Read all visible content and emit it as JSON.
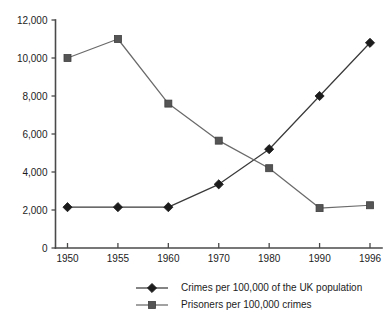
{
  "chart_data": {
    "type": "line",
    "title": "",
    "subtitle": "",
    "xlabel": "",
    "ylabel": "",
    "categories": [
      "1950",
      "1955",
      "1960",
      "1970",
      "1980",
      "1990",
      "1996"
    ],
    "ylim": [
      0,
      12000
    ],
    "ytick_labels": [
      "0",
      "2,000",
      "4,000",
      "6,000",
      "8,000",
      "10,000",
      "12,000"
    ],
    "ytick_values": [
      0,
      2000,
      4000,
      6000,
      8000,
      10000,
      12000
    ],
    "grid": false,
    "legend_position": "bottom-center",
    "series": [
      {
        "name": "Crimes per 100,000 of the UK population",
        "marker": "diamond",
        "color": "#1c1c1c",
        "line_color": "#3a3a3a",
        "values": [
          2150,
          2150,
          2150,
          3350,
          5200,
          8000,
          10800
        ]
      },
      {
        "name": "Prisoners per 100,000 crimes",
        "marker": "square",
        "color": "#555555",
        "line_color": "#6a6a6a",
        "values": [
          10000,
          11000,
          7600,
          5650,
          4200,
          2100,
          2250
        ]
      }
    ],
    "annotations": []
  },
  "legend": {
    "entries": [
      {
        "label": "Crimes per 100,000 of the UK population",
        "marker": "diamond-marker"
      },
      {
        "label": "Prisoners per 100,000 crimes",
        "marker": "square-marker"
      }
    ]
  }
}
